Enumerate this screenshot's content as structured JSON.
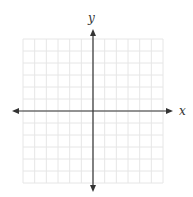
{
  "diagram": {
    "type": "coordinate-plane",
    "x_axis_label": "x",
    "y_axis_label": "y",
    "grid": {
      "cells_x": 12,
      "cells_y": 12,
      "left": 23,
      "top": 39,
      "right": 163,
      "bottom": 183,
      "line_color": "#e6e6e6"
    },
    "axes": {
      "origin_x": 93,
      "origin_y": 111,
      "x_start": 12,
      "x_end": 173,
      "y_start": 29,
      "y_end": 192,
      "color": "#333333"
    }
  }
}
